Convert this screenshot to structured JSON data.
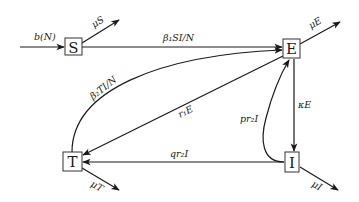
{
  "diagram": {
    "type": "compartmental-model-flow-diagram",
    "nodes": {
      "S": {
        "label": "S",
        "cx": 73,
        "cy": 47
      },
      "E": {
        "label": "E",
        "cx": 292,
        "cy": 48
      },
      "T": {
        "label": "T",
        "cx": 72,
        "cy": 162
      },
      "I": {
        "label": "I",
        "cx": 292,
        "cy": 162
      }
    },
    "edges": {
      "birth": {
        "from": "external",
        "to": "S",
        "label": "b(N)"
      },
      "death_S": {
        "from": "S",
        "to": "external",
        "label": "μS"
      },
      "S_to_E": {
        "from": "S",
        "to": "E",
        "label": "β₁SI/N"
      },
      "T_to_E": {
        "from": "T",
        "to": "E",
        "label": "β₂TI/N"
      },
      "E_to_T": {
        "from": "E",
        "to": "T",
        "label": "r₁E"
      },
      "death_E": {
        "from": "E",
        "to": "external",
        "label": "μE"
      },
      "E_to_I": {
        "from": "E",
        "to": "I",
        "label": "κE"
      },
      "I_to_E": {
        "from": "I",
        "to": "E",
        "label": "pr₂I"
      },
      "I_to_T": {
        "from": "I",
        "to": "T",
        "label": "qr₂I"
      },
      "death_T": {
        "from": "T",
        "to": "external",
        "label": "μT"
      },
      "death_I": {
        "from": "I",
        "to": "external",
        "label": "μI"
      }
    },
    "colors": {
      "stroke": "#1a1a1a",
      "box_border": "#333333",
      "background": "#ffffff"
    }
  }
}
